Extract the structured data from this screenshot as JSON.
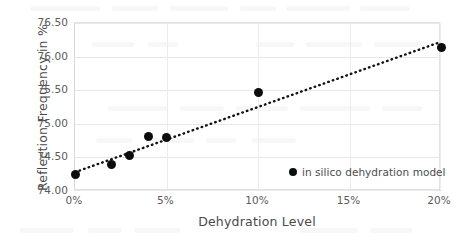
{
  "chart_data": {
    "type": "scatter",
    "title": "",
    "xlabel": "Dehydration Level",
    "ylabel": "Reflection Frequency in %",
    "xlim": [
      0,
      20
    ],
    "ylim": [
      74.0,
      76.5
    ],
    "xticks": [
      "0%",
      "5%",
      "10%",
      "15%",
      "20%"
    ],
    "xtick_values": [
      0,
      5,
      10,
      15,
      20
    ],
    "yticks": [
      "74.00",
      "74.50",
      "75.00",
      "75.50",
      "76.00",
      "76.50"
    ],
    "ytick_values": [
      74.0,
      74.5,
      75.0,
      75.5,
      76.0,
      76.5
    ],
    "grid": true,
    "legend_position": "inside-bottom-right",
    "series": [
      {
        "name": "in silico dehydration model",
        "marker": "circle",
        "color": "#0d0d0d",
        "x": [
          0,
          2,
          3,
          4,
          5,
          10,
          20
        ],
        "y": [
          74.25,
          74.39,
          74.53,
          74.81,
          74.8,
          75.47,
          76.13
        ]
      }
    ],
    "trendline": {
      "name": "linear trendline",
      "style": "dotted",
      "color": "#111111",
      "x_start": 0,
      "y_start": 74.28,
      "x_end": 20,
      "y_end": 76.22
    }
  },
  "legend": {
    "entries": [
      {
        "label": "in silico dehydration model",
        "marker_color": "#0d0d0d"
      }
    ]
  },
  "colors": {
    "marker": "#0d0d0d",
    "trendline": "#111111",
    "gridline": "#e8e8e8",
    "axis_text": "#5a5a5a",
    "title_text": "#4a4a4a",
    "background": "#ffffff"
  }
}
